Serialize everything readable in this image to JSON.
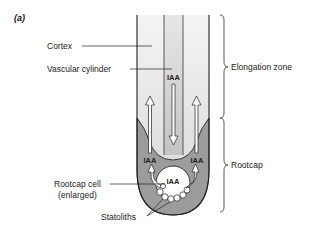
{
  "panel_label": "(a)",
  "labels": {
    "cortex": "Cortex",
    "vascular_cylinder": "Vascular cylinder",
    "rootcap_cell_line1": "Rootcap cell",
    "rootcap_cell_line2": "(enlarged)",
    "statoliths": "Statoliths",
    "elongation_zone": "Elongation zone",
    "rootcap": "Rootcap"
  },
  "iaa": {
    "center": "IAA",
    "left": "IAA",
    "right": "IAA",
    "cell": "IAA"
  },
  "colors": {
    "cortex_fill": "#e2e2e2",
    "vascular_fill": "#cfcfcf",
    "rootcap_fill": "#9c9c9c",
    "outline": "#222222",
    "arrow_fill": "#ffffff"
  }
}
